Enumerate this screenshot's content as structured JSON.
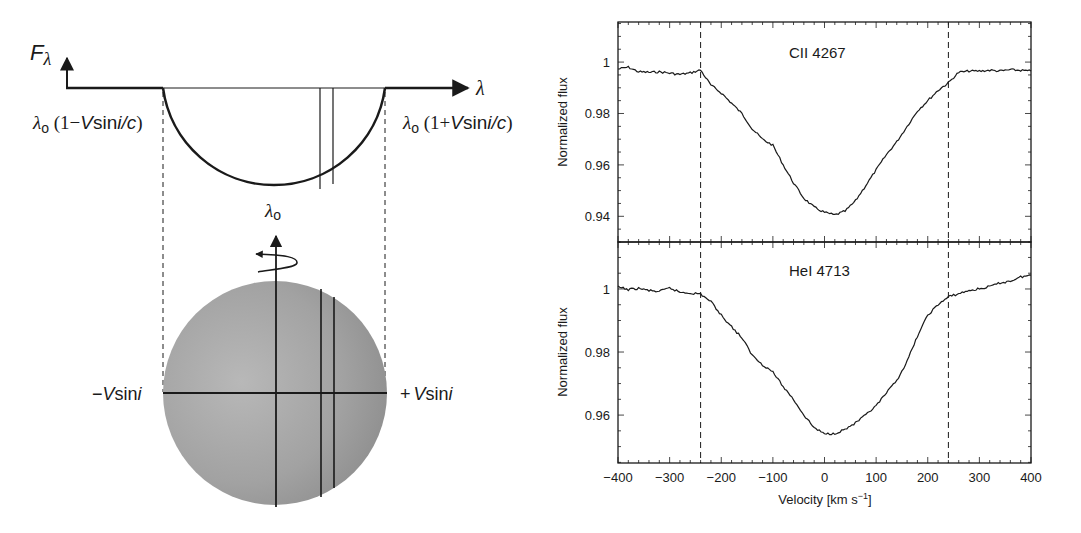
{
  "diagram": {
    "flux_axis_label": "F",
    "flux_axis_subscript": "λ",
    "wavelength_axis_label": "λ",
    "left_edge_label": {
      "lambda": "λ",
      "sub": "o",
      "paren_open": " (1−",
      "v": "V",
      "sin": "sin",
      "i": "i",
      "slash": "/",
      "c": "c",
      "paren_close": ")"
    },
    "right_edge_label": {
      "lambda": "λ",
      "sub": "o",
      "paren_open": " (1+",
      "v": "V",
      "sin": "sin",
      "i": "i",
      "slash": "/",
      "c": "c",
      "paren_close": ")"
    },
    "center_label": {
      "lambda": "λ",
      "sub": "o"
    },
    "minus_vsini_label": {
      "sign": "−",
      "v": "V",
      "sin": "sin",
      "i": "i"
    },
    "plus_vsini_label": {
      "sign": "+",
      "v": "V",
      "sin": "sin",
      "i": "i"
    },
    "colors": {
      "line": "#1a1a1a",
      "star_light": "#b4b4b4",
      "star_dark": "#8c8c8c"
    }
  },
  "chart_data": [
    {
      "type": "line",
      "title": "CII 4267",
      "xlabel": "Velocity [km s⁻¹]",
      "ylabel": "Normalized flux",
      "xlim": [
        -400,
        400
      ],
      "ylim": [
        0.93,
        1.0156
      ],
      "xticks": [
        -400,
        -300,
        -200,
        -100,
        0,
        100,
        200,
        300,
        400
      ],
      "yticks": [
        0.94,
        0.96,
        0.98,
        1
      ],
      "ytick_labels": [
        "0.94",
        "0.96",
        "0.98",
        "1"
      ],
      "vlines": [
        -240,
        240
      ],
      "grid": false,
      "series": [
        {
          "name": "CII 4267",
          "x": [
            -400,
            -380,
            -360,
            -340,
            -320,
            -300,
            -280,
            -260,
            -240,
            -220,
            -200,
            -180,
            -160,
            -140,
            -120,
            -100,
            -80,
            -60,
            -40,
            -20,
            0,
            20,
            40,
            60,
            80,
            100,
            120,
            140,
            160,
            180,
            200,
            220,
            240,
            260,
            280,
            300,
            320,
            340,
            360,
            380,
            400
          ],
          "values": [
            0.9973,
            0.998,
            0.9962,
            0.996,
            0.9962,
            0.9957,
            0.9952,
            0.9958,
            0.9969,
            0.991,
            0.988,
            0.984,
            0.98,
            0.974,
            0.97,
            0.9676,
            0.96,
            0.953,
            0.947,
            0.9435,
            0.9415,
            0.9405,
            0.942,
            0.946,
            0.952,
            0.958,
            0.964,
            0.969,
            0.975,
            0.981,
            0.985,
            0.989,
            0.992,
            0.996,
            0.9965,
            0.9965,
            0.9968,
            0.9965,
            0.997,
            0.9968,
            0.9965
          ]
        }
      ]
    },
    {
      "type": "line",
      "title": "HeI 4713",
      "xlabel": "Velocity [km s⁻¹]",
      "ylabel": "Normalized flux",
      "xlim": [
        -400,
        400
      ],
      "ylim": [
        0.9448,
        1.0149
      ],
      "xticks": [
        -400,
        -300,
        -200,
        -100,
        0,
        100,
        200,
        300,
        400
      ],
      "xtick_labels": [
        "−400",
        "−300",
        "−200",
        "−100",
        "0",
        "100",
        "200",
        "300",
        "400"
      ],
      "yticks": [
        0.96,
        0.98,
        1
      ],
      "ytick_labels": [
        "0.96",
        "0.98",
        "1"
      ],
      "vlines": [
        -240,
        240
      ],
      "grid": false,
      "series": [
        {
          "name": "HeI 4713",
          "x": [
            -400,
            -380,
            -360,
            -340,
            -320,
            -300,
            -280,
            -260,
            -240,
            -220,
            -200,
            -180,
            -160,
            -140,
            -120,
            -100,
            -80,
            -60,
            -40,
            -20,
            0,
            20,
            40,
            60,
            80,
            100,
            120,
            140,
            160,
            180,
            200,
            220,
            240,
            260,
            280,
            300,
            320,
            340,
            360,
            380,
            400
          ],
          "values": [
            1.0006,
            0.9998,
            1.0002,
            0.9995,
            0.9992,
            1.0003,
            0.999,
            0.9987,
            0.9984,
            0.996,
            0.9917,
            0.988,
            0.9845,
            0.979,
            0.976,
            0.9737,
            0.969,
            0.965,
            0.96,
            0.956,
            0.954,
            0.9542,
            0.9555,
            0.9575,
            0.96,
            0.9629,
            0.967,
            0.971,
            0.977,
            0.985,
            0.9917,
            0.995,
            0.9975,
            0.9985,
            0.9995,
            1.0,
            1.0008,
            1.0019,
            1.0025,
            1.0038,
            1.0044
          ]
        }
      ]
    }
  ],
  "plot_labels": {
    "top_title": "CII 4267",
    "bottom_title": "HeI 4713",
    "ylabel": "Normalized flux",
    "xlabel_main": "Velocity [km s",
    "xlabel_sup": "−1",
    "xlabel_close": "]"
  }
}
